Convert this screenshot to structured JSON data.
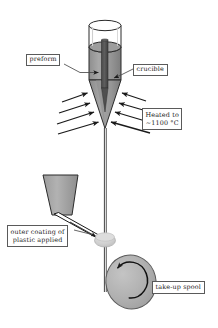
{
  "diagram": {
    "background_color": "#ffffff",
    "ink_color": "#1a1a1a",
    "fill_gray_mid": "#9a9a9a",
    "fill_gray_light": "#c9c9c9",
    "fill_gray_dark": "#555555",
    "callouts": {
      "preform": "preform",
      "crucible": "crucible",
      "heated_line1": "Heated to",
      "heated_line2": "~1100 °C",
      "coating_line1": "outer coating of",
      "coating_line2": "plastic applied",
      "spool": "take-up spool"
    },
    "parts": {
      "crucible_vessel": "crucible-vessel",
      "molten_fill": "molten-glass-fill",
      "preform_rod": "preform-rod",
      "crucible_cone": "crucible-taper-cone",
      "heat_arrows_left": "heat-arrows-left",
      "heat_arrows_right": "heat-arrows-right",
      "drawn_fiber": "drawn-fiber-line",
      "coating_hopper": "coating-hopper",
      "coating_nozzle": "coating-nozzle",
      "coating_die": "coating-die",
      "takeup_spool": "take-up-spool",
      "rotation_arrow": "spool-rotation-arrow"
    },
    "heat_arrow_count_left": 4,
    "heat_arrow_count_right": 4
  }
}
